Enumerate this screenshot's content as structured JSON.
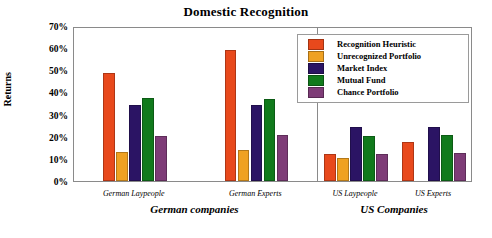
{
  "chart_data": {
    "type": "bar",
    "title": "Domestic Recognition",
    "xlabel": "",
    "ylabel": "Returns",
    "ylim": [
      0,
      70
    ],
    "ytick_labels": [
      "70%",
      "60%",
      "50%",
      "40%",
      "30%",
      "20%",
      "10%",
      "0%"
    ],
    "ytick_values": [
      70,
      60,
      50,
      40,
      30,
      20,
      10,
      0
    ],
    "grid": false,
    "legend_position": "top-right",
    "panels": [
      {
        "label": "German companies",
        "categories": [
          "German Laypeople",
          "German Experts"
        ]
      },
      {
        "label": "US Companies",
        "categories": [
          "US Laypeople",
          "US Experts"
        ]
      }
    ],
    "categories": [
      "German Laypeople",
      "German Experts",
      "US Laypeople",
      "US Experts"
    ],
    "series": [
      {
        "name": "Recognition Heuristic",
        "color": "#E8491C",
        "values": [
          49.0,
          59.0,
          12.0,
          17.5
        ]
      },
      {
        "name": "Unrecognized Portfolio",
        "color": "#EFA122",
        "values": [
          13.2,
          14.2,
          10.2,
          0
        ]
      },
      {
        "name": "Market Index",
        "color": "#2B1464",
        "values": [
          34.5,
          34.3,
          24.2,
          24.5
        ]
      },
      {
        "name": "Mutual Fund",
        "color": "#117A1C",
        "values": [
          37.5,
          37.0,
          20.5,
          21.0
        ]
      },
      {
        "name": "Chance Portfolio",
        "color": "#7E3C77",
        "values": [
          20.2,
          20.8,
          12.4,
          12.6
        ]
      }
    ]
  }
}
